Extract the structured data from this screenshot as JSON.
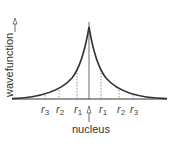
{
  "diagram": {
    "y_axis_label": "wavefunction",
    "x_marker_label": "nucleus",
    "radius_labels_left": [
      {
        "base": "r",
        "sub": "3"
      },
      {
        "base": "r",
        "sub": "2"
      },
      {
        "base": "r",
        "sub": "1"
      }
    ],
    "radius_labels_right": [
      {
        "base": "r",
        "sub": "1"
      },
      {
        "base": "r",
        "sub": "2"
      },
      {
        "base": "r",
        "sub": "3"
      }
    ],
    "curve_shape": "cusp exponential decay symmetric about nucleus",
    "colors": {
      "curve": "#333333",
      "axis": "#333333",
      "dotted_lines": "#555555",
      "text": "#333333"
    }
  }
}
